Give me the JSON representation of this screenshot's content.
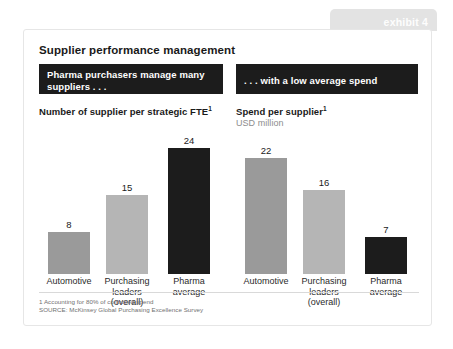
{
  "exhibit": {
    "tab_label": "exhibit 4",
    "tab_color": "#e3e3e3"
  },
  "card": {
    "title": "Supplier performance management"
  },
  "banners": {
    "left": "Pharma purchasers manage many suppliers . . .",
    "right": ". . . with a low average spend"
  },
  "footnote": {
    "note": "1  Accounting for 80% of controlled spend",
    "source": "SOURCE:  McKinsey Global Purchasing Excellence Survey"
  },
  "colors": {
    "bar_medium": "#9a9a9a",
    "bar_light": "#b5b5b5",
    "bar_dark": "#1c1c1c",
    "banner_bg": "#1c1c1c",
    "text_dark": "#1a1a1a",
    "text_muted": "#8d8d8d"
  },
  "chart_data": [
    {
      "type": "bar",
      "id": "suppliers-per-fte",
      "title": "Number of supplier per strategic FTE",
      "title_superscript": "1",
      "subtitle": "",
      "categories": [
        "Automotive",
        "Purchasing leaders (overall)",
        "Pharma average"
      ],
      "category_lines": [
        [
          "Automotive"
        ],
        [
          "Purchasing",
          "leaders",
          "(overall)"
        ],
        [
          "Pharma",
          "average"
        ]
      ],
      "values": [
        8,
        15,
        24
      ],
      "bar_colors": [
        "#9a9a9a",
        "#b5b5b5",
        "#1c1c1c"
      ],
      "ylim": [
        0,
        24
      ],
      "xlabel": "",
      "ylabel": "",
      "grid": false,
      "legend": "none",
      "data_labels": [
        "8",
        "15",
        "24"
      ]
    },
    {
      "type": "bar",
      "id": "spend-per-supplier",
      "title": "Spend per supplier",
      "title_superscript": "1",
      "subtitle": "USD million",
      "categories": [
        "Automotive",
        "Purchasing leaders (overall)",
        "Pharma average"
      ],
      "category_lines": [
        [
          "Automotive"
        ],
        [
          "Purchasing",
          "leaders",
          "(overall)"
        ],
        [
          "Pharma",
          "average"
        ]
      ],
      "values": [
        22,
        16,
        7
      ],
      "bar_colors": [
        "#9a9a9a",
        "#b5b5b5",
        "#1c1c1c"
      ],
      "ylim": [
        0,
        24
      ],
      "xlabel": "",
      "ylabel": "",
      "grid": false,
      "legend": "none",
      "data_labels": [
        "22",
        "16",
        "7"
      ]
    }
  ]
}
